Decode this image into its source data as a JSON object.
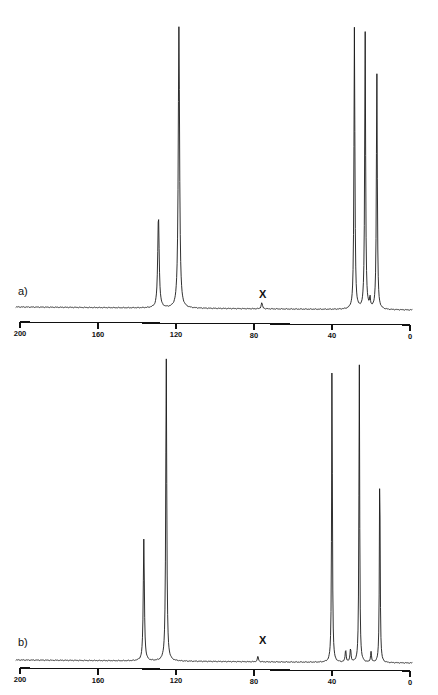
{
  "figure": {
    "width": 438,
    "height": 695,
    "background_color": "#ffffff",
    "trace_color": "#1a1a1a",
    "axis_color": "#111111"
  },
  "panels": [
    {
      "id": "panel-a",
      "label": "a)",
      "impurity_marker": "X",
      "impurity_ppm": 76,
      "axis": {
        "label": "",
        "unit": "ppm",
        "min": 0,
        "max": 200,
        "reversed": true,
        "ticks": [
          200,
          160,
          120,
          80,
          40,
          0
        ],
        "tick_labels": [
          "200",
          "160",
          "120",
          "80",
          "40",
          "0"
        ]
      },
      "peaks": [
        {
          "ppm": 129.0,
          "intensity": 0.33,
          "width": 0.65,
          "assignment": "aromatic CH"
        },
        {
          "ppm": 118.5,
          "intensity": 1.0,
          "width": 0.6,
          "assignment": "aromatic C"
        },
        {
          "ppm": 76.0,
          "intensity": 0.022,
          "width": 0.55,
          "assignment": "X impurity"
        },
        {
          "ppm": 28.5,
          "intensity": 1.0,
          "width": 0.42,
          "assignment": "aliphatic CH2"
        },
        {
          "ppm": 23.0,
          "intensity": 0.99,
          "width": 0.42,
          "assignment": "aliphatic CH2"
        },
        {
          "ppm": 17.0,
          "intensity": 0.84,
          "width": 0.42,
          "assignment": "aliphatic CH3"
        },
        {
          "ppm": 20.5,
          "intensity": 0.035,
          "width": 0.4,
          "assignment": "minor"
        }
      ]
    },
    {
      "id": "panel-b",
      "label": "b)",
      "impurity_marker": "X",
      "impurity_ppm": 78,
      "axis": {
        "label": "",
        "unit": "ppm",
        "min": 0,
        "max": 200,
        "reversed": true,
        "ticks": [
          200,
          160,
          120,
          80,
          40,
          0
        ],
        "tick_labels": [
          "200",
          "160",
          "120",
          "80",
          "40",
          "0"
        ]
      },
      "peaks": [
        {
          "ppm": 136.5,
          "intensity": 0.4,
          "width": 0.5,
          "assignment": "aromatic CH"
        },
        {
          "ppm": 125.0,
          "intensity": 1.0,
          "width": 0.45,
          "assignment": "aromatic C"
        },
        {
          "ppm": 78.0,
          "intensity": 0.018,
          "width": 0.5,
          "assignment": "X impurity"
        },
        {
          "ppm": 40.0,
          "intensity": 1.0,
          "width": 0.34,
          "assignment": "aliphatic CH2"
        },
        {
          "ppm": 33.0,
          "intensity": 0.04,
          "width": 0.45,
          "assignment": "minor"
        },
        {
          "ppm": 30.5,
          "intensity": 0.045,
          "width": 0.45,
          "assignment": "minor"
        },
        {
          "ppm": 26.0,
          "intensity": 0.99,
          "width": 0.34,
          "assignment": "aliphatic CH2"
        },
        {
          "ppm": 20.0,
          "intensity": 0.035,
          "width": 0.4,
          "assignment": "minor"
        },
        {
          "ppm": 15.5,
          "intensity": 0.66,
          "width": 0.34,
          "assignment": "aliphatic CH3"
        }
      ]
    }
  ],
  "chart_data": {
    "type": "line",
    "xlabel": "ppm",
    "ylabel": "intensity",
    "xlim": [
      200,
      0
    ],
    "ylim": [
      0,
      1
    ],
    "grid": false,
    "legend": null,
    "annotations": [
      "a)",
      "b)",
      "X",
      "X"
    ],
    "series": [
      {
        "name": "a)",
        "x": [
          129.0,
          118.5,
          76.0,
          28.5,
          23.0,
          20.5,
          17.0
        ],
        "values": [
          0.33,
          1.0,
          0.022,
          1.0,
          0.99,
          0.035,
          0.84
        ]
      },
      {
        "name": "b)",
        "x": [
          136.5,
          125.0,
          78.0,
          40.0,
          33.0,
          30.5,
          26.0,
          20.0,
          15.5
        ],
        "values": [
          0.4,
          1.0,
          0.018,
          1.0,
          0.045,
          0.04,
          0.99,
          0.035,
          0.66
        ]
      }
    ],
    "xticks": [
      200,
      160,
      120,
      80,
      40,
      0
    ],
    "xtick_labels": [
      "200",
      "160",
      "120",
      "80",
      "40",
      "0"
    ]
  }
}
